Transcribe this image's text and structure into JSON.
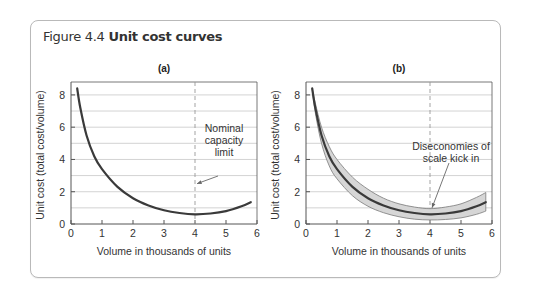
{
  "figure": {
    "number": "Figure 4.4",
    "title": "Unit cost curves"
  },
  "colors": {
    "curve": "#3a3a3a",
    "band_fill": "#d6d6d6",
    "band_edge": "#7a7a7a",
    "grid": "#c8c8c8",
    "axis": "#555555",
    "dashed": "#999999",
    "card_border": "#b9b9b9"
  },
  "chart_data": [
    {
      "type": "line",
      "panel": "(a)",
      "title": "(a)",
      "xlabel": "Volume in thousands of units",
      "ylabel": "Unit cost (total cost/volume)",
      "xlim": [
        0,
        6
      ],
      "ylim": [
        0,
        8.8
      ],
      "xticks": [
        0,
        1,
        2,
        3,
        4,
        5,
        6
      ],
      "yticks": [
        0,
        2,
        4,
        6,
        8
      ],
      "grid": "horizontal every 1",
      "series": [
        {
          "name": "Unit cost",
          "x": [
            0.2,
            0.3,
            0.5,
            0.75,
            1.0,
            1.5,
            2.0,
            2.5,
            3.0,
            3.5,
            4.0,
            4.5,
            5.0,
            5.5,
            5.8
          ],
          "y": [
            8.4,
            7.2,
            5.5,
            4.2,
            3.4,
            2.3,
            1.6,
            1.15,
            0.85,
            0.68,
            0.6,
            0.65,
            0.8,
            1.1,
            1.35
          ]
        }
      ],
      "reference_line": {
        "x": 4,
        "style": "dashed",
        "label": "Nominal capacity limit"
      },
      "annotations": [
        {
          "text_lines": [
            "Nominal",
            "capacity",
            "limit"
          ],
          "arrow_to": [
            4,
            2.5
          ]
        }
      ]
    },
    {
      "type": "area",
      "panel": "(b)",
      "title": "(b)",
      "xlabel": "Volume in thousands of units",
      "ylabel": "Unit cost (total cost/volume)",
      "xlim": [
        0,
        6
      ],
      "ylim": [
        0,
        8.8
      ],
      "xticks": [
        0,
        1,
        2,
        3,
        4,
        5,
        6
      ],
      "yticks": [
        0,
        2,
        4,
        6,
        8
      ],
      "grid": "horizontal every 1",
      "series": [
        {
          "name": "Unit cost (central)",
          "x": [
            0.2,
            0.3,
            0.5,
            0.75,
            1.0,
            1.5,
            2.0,
            2.5,
            3.0,
            3.5,
            4.0,
            4.5,
            5.0,
            5.5,
            5.8
          ],
          "y": [
            8.4,
            7.2,
            5.5,
            4.2,
            3.4,
            2.3,
            1.6,
            1.15,
            0.85,
            0.68,
            0.6,
            0.65,
            0.8,
            1.1,
            1.35
          ]
        },
        {
          "name": "Upper bound",
          "x": [
            0.2,
            0.3,
            0.5,
            0.75,
            1.0,
            1.5,
            2.0,
            2.5,
            3.0,
            3.5,
            4.0,
            4.5,
            5.0,
            5.5,
            5.8
          ],
          "y": [
            8.4,
            7.5,
            6.0,
            4.8,
            4.0,
            2.9,
            2.15,
            1.6,
            1.25,
            1.05,
            0.95,
            1.05,
            1.25,
            1.65,
            1.95
          ]
        },
        {
          "name": "Lower bound",
          "x": [
            0.2,
            0.3,
            0.5,
            0.75,
            1.0,
            1.5,
            2.0,
            2.5,
            3.0,
            3.5,
            4.0,
            4.5,
            5.0,
            5.5,
            5.8
          ],
          "y": [
            8.4,
            6.9,
            5.0,
            3.6,
            2.8,
            1.75,
            1.1,
            0.7,
            0.45,
            0.3,
            0.25,
            0.28,
            0.38,
            0.6,
            0.8
          ]
        }
      ],
      "reference_line": {
        "x": 4,
        "style": "dashed",
        "label": "Diseconomies of scale kick in"
      },
      "annotations": [
        {
          "text_lines": [
            "Diseconomies of",
            "scale kick in"
          ],
          "arrow_to": [
            4,
            1.0
          ]
        }
      ]
    }
  ]
}
